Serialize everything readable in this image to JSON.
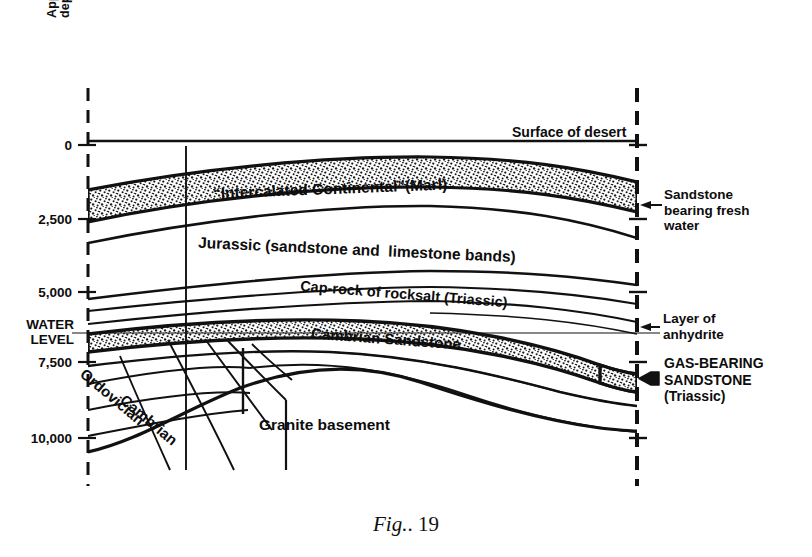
{
  "figure": {
    "caption_prefix": "Fig.",
    "caption_number": "19"
  },
  "axis": {
    "title": "Approximate\ndepth in feet",
    "ticks": [
      {
        "label": "0",
        "depth": 0
      },
      {
        "label": "2,500",
        "depth": 2500
      },
      {
        "label": "5,000",
        "depth": 5000
      },
      {
        "label": "7,500",
        "depth": 7500
      },
      {
        "label": "10,000",
        "depth": 10000
      }
    ],
    "water_level_label": "WATER\nLEVEL"
  },
  "surface": {
    "label": "Surface of desert"
  },
  "strata": [
    {
      "name": "sandstone-fresh-water",
      "label": "",
      "pattern": "stipple"
    },
    {
      "name": "intercalated-continental",
      "label": "“Intercalated Continental”(Marl)",
      "pattern": "plain"
    },
    {
      "name": "jurassic",
      "label": "Jurassic (sandstone and  limestone bands)",
      "pattern": "plain"
    },
    {
      "name": "cap-rock",
      "label": "Cap-rock of rocksalt (Triassic)",
      "pattern": "plain"
    },
    {
      "name": "cambrian-sandstone",
      "label": "Cambrian Sandstone",
      "pattern": "stipple"
    },
    {
      "name": "ordovician",
      "label": "Ordovician",
      "pattern": "plain"
    },
    {
      "name": "cambrian",
      "label": "Cambrian",
      "pattern": "plain"
    },
    {
      "name": "granite-basement",
      "label": "Granite basement",
      "pattern": "plain"
    }
  ],
  "annotations": [
    {
      "name": "sandstone-fresh-water",
      "text": "Sandstone\nbearing fresh\nwater",
      "arrow": "thin-left",
      "bold": true
    },
    {
      "name": "layer-of-anhydrite",
      "text": "Layer of\nanhydrite",
      "arrow": "thin-left",
      "bold": true
    },
    {
      "name": "gas-bearing-sandstone",
      "text": "GAS-BEARING\nSANDSTONE\n(Triassic)",
      "arrow": "thick-left",
      "bold": true
    }
  ],
  "colors": {
    "ink": "#0d0d0d",
    "background": "#ffffff",
    "stipple": "#1a1a1a"
  },
  "boundaries": {
    "left_dashed_x": 88,
    "right_dashed_x": 637,
    "top_y": 88,
    "bottom_y": 486
  }
}
